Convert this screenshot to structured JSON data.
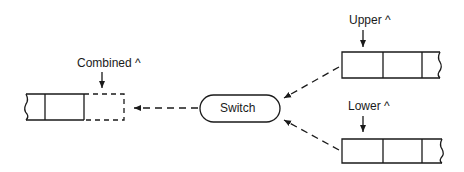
{
  "diagram": {
    "nodes": {
      "combined": {
        "label": "Combined ^"
      },
      "switch": {
        "label": "Switch"
      },
      "upper": {
        "label": "Upper ^"
      },
      "lower": {
        "label": "Lower ^"
      }
    },
    "edges": [
      {
        "from": "upper",
        "to": "switch",
        "style": "dashed"
      },
      {
        "from": "lower",
        "to": "switch",
        "style": "dashed"
      },
      {
        "from": "switch",
        "to": "combined",
        "style": "dashed"
      }
    ],
    "colors": {
      "stroke": "#1a1a1a",
      "background": "#ffffff"
    }
  }
}
